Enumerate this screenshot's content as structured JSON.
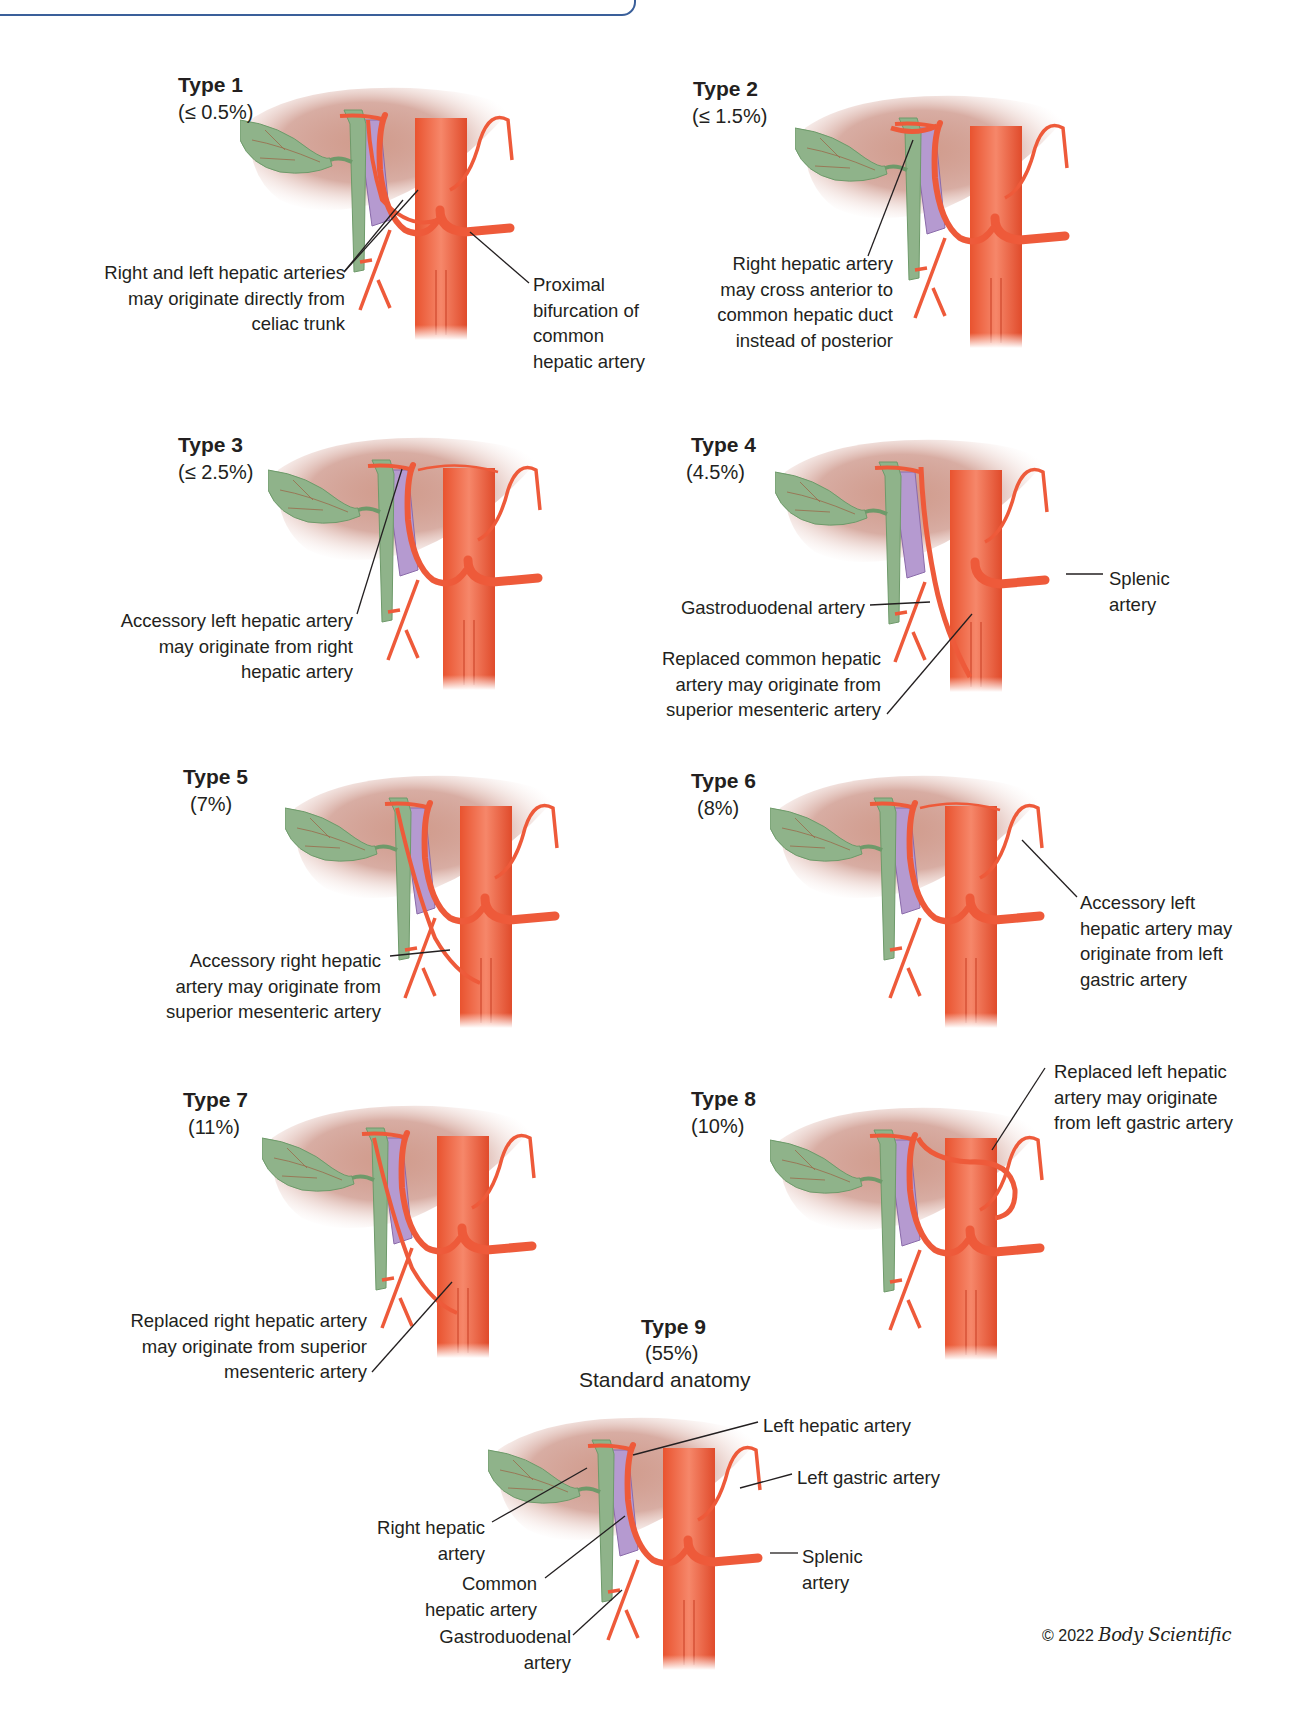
{
  "header_box": {
    "text": ""
  },
  "colors": {
    "artery": "#ee5a3a",
    "artery_dark": "#d8432a",
    "duct": "#8fb38a",
    "duct_dark": "#6e9a6a",
    "vein": "#b59ad0",
    "liver": "#b86a58",
    "leader": "#231f20"
  },
  "types": [
    {
      "id": "type1",
      "title": "Type 1",
      "pct": "(≤ 0.5%)",
      "labels": [
        {
          "text": "Right and left hepatic arteries\nmay originate directly from\nceliac trunk"
        },
        {
          "text": "Proximal\nbifurcation of\ncommon\nhepatic artery"
        }
      ]
    },
    {
      "id": "type2",
      "title": "Type 2",
      "pct": "(≤ 1.5%)",
      "labels": [
        {
          "text": "Right hepatic artery\nmay cross anterior to\ncommon hepatic duct\ninstead of posterior"
        }
      ]
    },
    {
      "id": "type3",
      "title": "Type 3",
      "pct": "(≤ 2.5%)",
      "labels": [
        {
          "text": "Accessory left hepatic artery\nmay originate from right\nhepatic artery"
        }
      ]
    },
    {
      "id": "type4",
      "title": "Type 4",
      "pct": "(4.5%)",
      "labels": [
        {
          "text": "Gastroduodenal artery"
        },
        {
          "text": "Splenic\nartery"
        },
        {
          "text": "Replaced common hepatic\nartery may originate from\nsuperior mesenteric artery"
        }
      ]
    },
    {
      "id": "type5",
      "title": "Type 5",
      "pct": "(7%)",
      "labels": [
        {
          "text": "Accessory right hepatic\nartery may originate from\nsuperior mesenteric artery"
        }
      ]
    },
    {
      "id": "type6",
      "title": "Type 6",
      "pct": "(8%)",
      "labels": [
        {
          "text": "Accessory left\nhepatic artery may\noriginate from left\ngastric artery"
        }
      ]
    },
    {
      "id": "type7",
      "title": "Type 7",
      "pct": "(11%)",
      "labels": [
        {
          "text": "Replaced right hepatic artery\nmay originate from superior\nmesenteric artery"
        }
      ]
    },
    {
      "id": "type8",
      "title": "Type 8",
      "pct": "(10%)",
      "labels": [
        {
          "text": "Replaced left hepatic\nartery may originate\nfrom left gastric artery"
        }
      ]
    },
    {
      "id": "type9",
      "title": "Type 9",
      "pct": "(55%)",
      "subtitle": "Standard anatomy",
      "labels": [
        {
          "text": "Left hepatic artery"
        },
        {
          "text": "Left gastric artery"
        },
        {
          "text": "Right hepatic\nartery"
        },
        {
          "text": "Common\nhepatic artery"
        },
        {
          "text": "Splenic\nartery"
        },
        {
          "text": "Gastroduodenal\nartery"
        }
      ]
    }
  ],
  "copyright": {
    "prefix": "© 2022",
    "brand": "Body Scientific"
  }
}
